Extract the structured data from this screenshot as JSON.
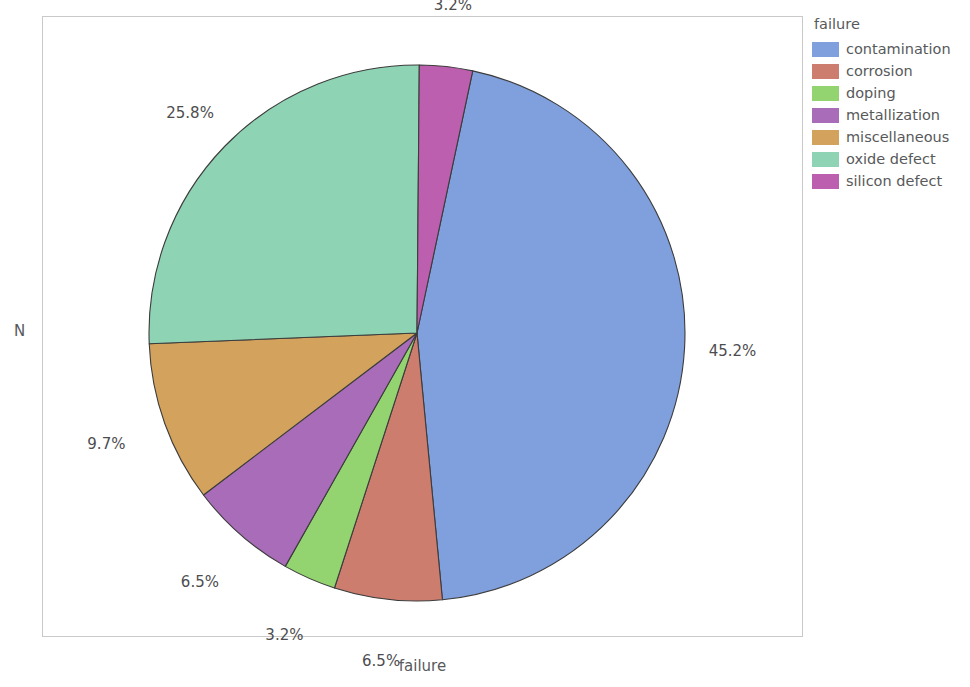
{
  "chart_data": {
    "type": "pie",
    "title": "",
    "xlabel": "failure",
    "ylabel": "N",
    "legend_title": "failure",
    "legend_position": "right",
    "grid": false,
    "categories": [
      "contamination",
      "corrosion",
      "doping",
      "metallization",
      "miscellaneous",
      "oxide defect",
      "silicon defect"
    ],
    "values": [
      45.2,
      6.5,
      3.2,
      6.5,
      9.7,
      25.8,
      3.2
    ],
    "value_unit": "percent",
    "labels": [
      "45.2%",
      "6.5%",
      "3.2%",
      "6.5%",
      "9.7%",
      "25.8%",
      "3.2%"
    ],
    "colors": [
      "#7f9fdd",
      "#cc7d6d",
      "#93d470",
      "#a86cb8",
      "#d3a25c",
      "#8ed3b4",
      "#bb5fae"
    ],
    "slices": [
      {
        "name": "contamination",
        "value": 45.2,
        "label": "45.2%",
        "color": "#7f9fdd"
      },
      {
        "name": "corrosion",
        "value": 6.5,
        "label": "6.5%",
        "color": "#cc7d6d"
      },
      {
        "name": "doping",
        "value": 3.2,
        "label": "3.2%",
        "color": "#93d470"
      },
      {
        "name": "metallization",
        "value": 6.5,
        "label": "6.5%",
        "color": "#a86cb8"
      },
      {
        "name": "miscellaneous",
        "value": 9.7,
        "label": "9.7%",
        "color": "#d3a25c"
      },
      {
        "name": "oxide defect",
        "value": 25.8,
        "label": "25.8%",
        "color": "#8ed3b4"
      },
      {
        "name": "silicon defect",
        "value": 3.2,
        "label": "3.2%",
        "color": "#bb5fae"
      }
    ]
  },
  "axes": {
    "y_label": "N",
    "x_label": "failure"
  },
  "legend": {
    "title": "failure",
    "items": [
      {
        "label": "contamination",
        "color": "#7f9fdd"
      },
      {
        "label": "corrosion",
        "color": "#cc7d6d"
      },
      {
        "label": "doping",
        "color": "#93d470"
      },
      {
        "label": "metallization",
        "color": "#a86cb8"
      },
      {
        "label": "miscellaneous",
        "color": "#d3a25c"
      },
      {
        "label": "oxide defect",
        "color": "#8ed3b4"
      },
      {
        "label": "silicon defect",
        "color": "#bb5fae"
      }
    ]
  },
  "style": {
    "frame_color": "#c9c9c9",
    "text_color": "#58595b",
    "label_color": "#4d4d4f",
    "background": "#ffffff",
    "slice_outline": "#3c3c3c"
  }
}
